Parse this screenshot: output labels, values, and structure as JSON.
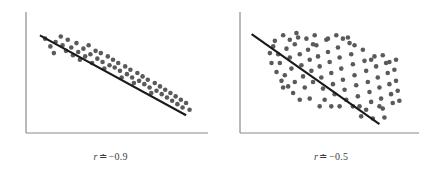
{
  "figure": {
    "type": "scatterplot-pair",
    "background_color": "#ffffff",
    "axis_color": "#8a8a8a",
    "dot_color": "#5a5a5a",
    "line_color": "#1a1a1a",
    "dot_radius": 2.3,
    "line_width": 2.1,
    "axis_width": 1.2
  },
  "chart_data": [
    {
      "type": "scatter",
      "title": "",
      "subtitle": "",
      "xlabel": "",
      "ylabel": "",
      "caption": "r ≐ −0.9",
      "caption_symbol": "r",
      "caption_relation": "≐",
      "caption_value": "−0.9",
      "correlation": -0.9,
      "grid": false,
      "legend": "none",
      "xlim": [
        0,
        100
      ],
      "ylim": [
        0,
        100
      ],
      "axes": {
        "left": true,
        "bottom": true,
        "top": false,
        "right": false
      },
      "trendline": {
        "x": [
          8,
          92
        ],
        "y": [
          88,
          16
        ]
      },
      "n_points": 56,
      "points": [
        [
          11,
          85
        ],
        [
          14,
          78
        ],
        [
          17,
          82
        ],
        [
          16,
          72
        ],
        [
          20,
          87
        ],
        [
          21,
          79
        ],
        [
          23,
          74
        ],
        [
          24,
          84
        ],
        [
          26,
          77
        ],
        [
          27,
          70
        ],
        [
          29,
          81
        ],
        [
          30,
          73
        ],
        [
          31,
          66
        ],
        [
          33,
          76
        ],
        [
          34,
          69
        ],
        [
          36,
          79
        ],
        [
          37,
          71
        ],
        [
          38,
          63
        ],
        [
          40,
          74
        ],
        [
          41,
          67
        ],
        [
          43,
          72
        ],
        [
          44,
          64
        ],
        [
          45,
          58
        ],
        [
          47,
          69
        ],
        [
          48,
          61
        ],
        [
          50,
          66
        ],
        [
          51,
          59
        ],
        [
          53,
          63
        ],
        [
          54,
          56
        ],
        [
          55,
          50
        ],
        [
          57,
          60
        ],
        [
          58,
          53
        ],
        [
          60,
          57
        ],
        [
          61,
          50
        ],
        [
          62,
          45
        ],
        [
          64,
          54
        ],
        [
          65,
          47
        ],
        [
          67,
          51
        ],
        [
          68,
          44
        ],
        [
          70,
          48
        ],
        [
          71,
          41
        ],
        [
          72,
          36
        ],
        [
          74,
          45
        ],
        [
          75,
          38
        ],
        [
          77,
          42
        ],
        [
          78,
          35
        ],
        [
          80,
          39
        ],
        [
          81,
          32
        ],
        [
          83,
          36
        ],
        [
          84,
          29
        ],
        [
          86,
          33
        ],
        [
          87,
          26
        ],
        [
          89,
          30
        ],
        [
          90,
          23
        ],
        [
          92,
          27
        ],
        [
          94,
          21
        ]
      ]
    },
    {
      "type": "scatter",
      "title": "",
      "subtitle": "",
      "xlabel": "",
      "ylabel": "",
      "caption": "r ≐ −0.5",
      "caption_symbol": "r",
      "caption_relation": "≐",
      "caption_value": "−0.5",
      "correlation": -0.5,
      "grid": false,
      "legend": "none",
      "xlim": [
        0,
        100
      ],
      "ylim": [
        0,
        100
      ],
      "axes": {
        "left": true,
        "bottom": true,
        "top": false,
        "right": false
      },
      "trendline": {
        "x": [
          7,
          84
        ],
        "y": [
          89,
          8
        ]
      },
      "n_points": 98,
      "points": [
        [
          18,
          72
        ],
        [
          21,
          83
        ],
        [
          24,
          63
        ],
        [
          26,
          88
        ],
        [
          28,
          76
        ],
        [
          30,
          68
        ],
        [
          31,
          58
        ],
        [
          33,
          80
        ],
        [
          34,
          90
        ],
        [
          36,
          71
        ],
        [
          37,
          61
        ],
        [
          38,
          51
        ],
        [
          40,
          85
        ],
        [
          41,
          75
        ],
        [
          42,
          66
        ],
        [
          43,
          56
        ],
        [
          44,
          46
        ],
        [
          46,
          79
        ],
        [
          47,
          69
        ],
        [
          48,
          60
        ],
        [
          49,
          50
        ],
        [
          50,
          40
        ],
        [
          52,
          84
        ],
        [
          53,
          73
        ],
        [
          54,
          64
        ],
        [
          55,
          54
        ],
        [
          56,
          44
        ],
        [
          57,
          35
        ],
        [
          59,
          77
        ],
        [
          60,
          68
        ],
        [
          61,
          58
        ],
        [
          62,
          48
        ],
        [
          63,
          39
        ],
        [
          64,
          30
        ],
        [
          66,
          81
        ],
        [
          67,
          71
        ],
        [
          68,
          62
        ],
        [
          69,
          52
        ],
        [
          70,
          43
        ],
        [
          71,
          33
        ],
        [
          72,
          24
        ],
        [
          74,
          75
        ],
        [
          75,
          65
        ],
        [
          76,
          56
        ],
        [
          77,
          46
        ],
        [
          78,
          37
        ],
        [
          79,
          28
        ],
        [
          81,
          69
        ],
        [
          82,
          60
        ],
        [
          83,
          50
        ],
        [
          84,
          41
        ],
        [
          85,
          31
        ],
        [
          86,
          22
        ],
        [
          88,
          63
        ],
        [
          89,
          54
        ],
        [
          90,
          44
        ],
        [
          91,
          35
        ],
        [
          93,
          57
        ],
        [
          94,
          47
        ],
        [
          95,
          38
        ],
        [
          22,
          55
        ],
        [
          25,
          47
        ],
        [
          29,
          42
        ],
        [
          32,
          36
        ],
        [
          35,
          86
        ],
        [
          39,
          41
        ],
        [
          45,
          88
        ],
        [
          51,
          30
        ],
        [
          58,
          88
        ],
        [
          65,
          86
        ],
        [
          73,
          15
        ],
        [
          80,
          13
        ],
        [
          87,
          14
        ],
        [
          92,
          27
        ],
        [
          96,
          29
        ],
        [
          19,
          63
        ],
        [
          23,
          71
        ],
        [
          27,
          52
        ],
        [
          30,
          84
        ],
        [
          33,
          46
        ],
        [
          42,
          31
        ],
        [
          48,
          24
        ],
        [
          55,
          24
        ],
        [
          62,
          85
        ],
        [
          69,
          79
        ],
        [
          76,
          21
        ],
        [
          84,
          24
        ],
        [
          90,
          64
        ],
        [
          94,
          66
        ],
        [
          20,
          78
        ],
        [
          26,
          41
        ],
        [
          36,
          30
        ],
        [
          44,
          80
        ],
        [
          53,
          85
        ],
        [
          60,
          24
        ],
        [
          68,
          24
        ],
        [
          79,
          66
        ],
        [
          86,
          70
        ]
      ]
    }
  ]
}
